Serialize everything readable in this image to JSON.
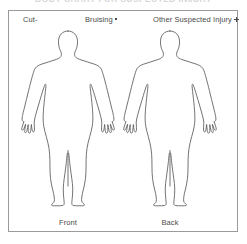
{
  "page": {
    "cutoff_title": "BODY CHART FOR SUSPECTED INJURY"
  },
  "legend": {
    "items": [
      {
        "label": "Cut-",
        "marker": "dash-marker",
        "marker_symbol": "-"
      },
      {
        "label": "Bruising",
        "marker": "dot-marker",
        "marker_symbol": "•"
      },
      {
        "label": "Other Suspected Injury",
        "marker": "plus-marker",
        "marker_symbol": "+"
      }
    ]
  },
  "figures": [
    {
      "caption": "Front",
      "view": "anterior-body-outline"
    },
    {
      "caption": "Back",
      "view": "posterior-body-outline"
    }
  ],
  "colors": {
    "outline": "#5a5a5a",
    "border": "#9a9a9a",
    "text": "#4a4a4a",
    "background": "#ffffff"
  }
}
